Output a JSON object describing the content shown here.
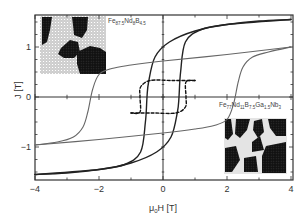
{
  "chart_data": {
    "type": "line",
    "title": "",
    "xlabel": "μ0H [T]",
    "ylabel": "J [T]",
    "xlim": [
      -4,
      4
    ],
    "ylim": [
      -1.65,
      1.65
    ],
    "x_ticks": [
      "-4",
      "-2",
      "0",
      "2",
      "4"
    ],
    "y_ticks": [
      "-1",
      "0",
      "1"
    ],
    "grid": false,
    "legend": null,
    "annotations": [
      {
        "text": "Fe87.5Nd8B4.5",
        "position": "top-left inset",
        "description": "nanocomposite microstructure inset (exchange-coupled soft/hard grains)"
      },
      {
        "text": "Fe77Nd11B7.5Ga1.5Nb3",
        "position": "bottom-right inset",
        "description": "decoupled grain microstructure inset"
      }
    ],
    "series": [
      {
        "name": "Fe87.5Nd8B4.5 (narrow loop, dark)",
        "color": "#222222",
        "style": "solid",
        "descending_branch": {
          "x": [
            4.0,
            2.0,
            1.0,
            0.2,
            -0.25,
            -0.45,
            -0.5,
            -0.55,
            -0.7,
            -1.2,
            -2.0,
            -3.0,
            -4.0
          ],
          "y": [
            1.55,
            1.45,
            1.32,
            1.1,
            0.8,
            0.3,
            0.0,
            -0.5,
            -1.1,
            -1.35,
            -1.45,
            -1.52,
            -1.55
          ]
        },
        "ascending_branch": {
          "x": [
            -4.0,
            -2.0,
            -1.0,
            -0.2,
            0.25,
            0.45,
            0.5,
            0.55,
            0.7,
            1.2,
            2.0,
            3.0,
            4.0
          ],
          "y": [
            -1.55,
            -1.45,
            -1.32,
            -1.1,
            -0.8,
            -0.3,
            0.0,
            0.5,
            1.1,
            1.35,
            1.45,
            1.52,
            1.55
          ]
        }
      },
      {
        "name": "Fe77Nd11B7.5Ga1.5Nb3 (wide loop, gray)",
        "color": "#666666",
        "style": "solid",
        "descending_branch": {
          "x": [
            4.0,
            2.0,
            0.0,
            -1.0,
            -1.6,
            -2.0,
            -2.2,
            -2.35,
            -2.5,
            -2.8,
            -3.3,
            -4.0
          ],
          "y": [
            1.0,
            0.85,
            0.72,
            0.64,
            0.57,
            0.45,
            0.15,
            -0.3,
            -0.6,
            -0.8,
            -0.9,
            -0.96
          ]
        },
        "ascending_branch": {
          "x": [
            -4.0,
            -2.0,
            0.0,
            1.0,
            1.6,
            2.0,
            2.2,
            2.35,
            2.5,
            2.8,
            3.3,
            4.0
          ],
          "y": [
            -0.96,
            -0.85,
            -0.72,
            -0.64,
            -0.57,
            -0.45,
            -0.15,
            0.3,
            0.6,
            0.8,
            0.9,
            1.0
          ]
        }
      },
      {
        "name": "minor loop (dashed)",
        "color": "#111111",
        "style": "dashed",
        "descending_branch": {
          "x": [
            1.0,
            0.3,
            -0.4,
            -0.7,
            -0.72,
            -0.72,
            -1.0
          ],
          "y": [
            0.33,
            0.33,
            0.33,
            0.2,
            0.0,
            -0.3,
            -0.32
          ]
        },
        "ascending_branch": {
          "x": [
            -1.0,
            -0.3,
            0.4,
            0.7,
            0.72,
            0.72,
            1.0
          ],
          "y": [
            -0.32,
            -0.32,
            -0.32,
            -0.2,
            0.0,
            0.3,
            0.33
          ]
        }
      }
    ]
  },
  "labels": {
    "xlabel_prefix": "μ",
    "xlabel_sub": "0",
    "xlabel_rest": "H [T]",
    "ylabel": "J [T]",
    "inset1_base": [
      "Fe",
      "87.5",
      "Nd",
      "8",
      "B",
      "4.5"
    ],
    "inset2_base": [
      "Fe",
      "77",
      "Nd",
      "11",
      "B",
      "7.5",
      "Ga",
      "1.5",
      "Nb",
      "3"
    ],
    "x_ticks": [
      "−4",
      "−2",
      "0",
      "2",
      "4"
    ],
    "y_ticks": [
      "1",
      "0",
      "−1"
    ]
  }
}
